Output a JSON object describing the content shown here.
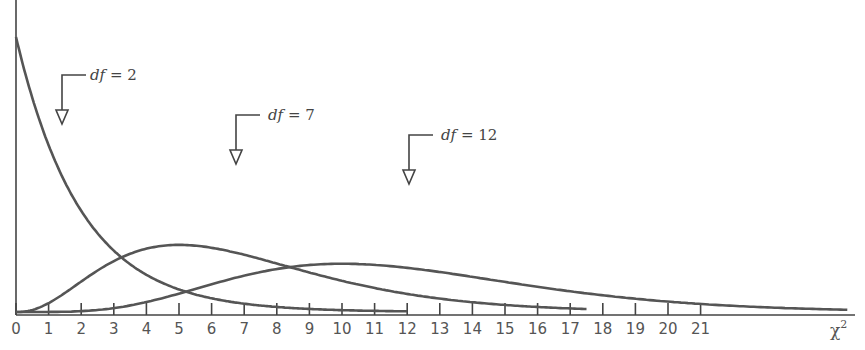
{
  "chart_data": {
    "type": "line",
    "title": "",
    "xlabel": "χ²",
    "ylabel": "",
    "xlim": [
      0,
      25.5
    ],
    "grid": false,
    "legend": "none (inline callout labels with arrows)",
    "x_ticks": [
      0,
      1,
      2,
      3,
      4,
      5,
      6,
      7,
      8,
      9,
      10,
      11,
      12,
      13,
      14,
      15,
      16,
      17,
      18,
      19,
      20,
      21
    ],
    "x_tick_labels": [
      "0",
      "1",
      "2",
      "3",
      "4",
      "5",
      "6",
      "7",
      "8",
      "9",
      "10",
      "11",
      "12",
      "13",
      "14",
      "15",
      "16",
      "17",
      "18",
      "19",
      "20",
      "21"
    ],
    "series": [
      {
        "name": "df = 2",
        "df": 2,
        "x_range": [
          0,
          12
        ],
        "shape": "decreasing exponential from y-axis",
        "peak_x": 0
      },
      {
        "name": "df = 7",
        "df": 7,
        "x_range": [
          0,
          17.5
        ],
        "shape": "right-skewed",
        "peak_x": 5
      },
      {
        "name": "df = 12",
        "df": 12,
        "x_range": [
          0,
          25.5
        ],
        "shape": "right-skewed",
        "peak_x": 10
      }
    ],
    "annotations": [
      {
        "text": "df = 2",
        "arrow_x": 1.4
      },
      {
        "text": "df = 7",
        "arrow_x": 6.7
      },
      {
        "text": "df = 12",
        "arrow_x": 12
      }
    ]
  },
  "labels": {
    "axis_title": "χ",
    "axis_title_sup": "2",
    "df2": {
      "prefix": "df",
      "suffix": " = 2"
    },
    "df7": {
      "prefix": "df",
      "suffix": " = 7"
    },
    "df12": {
      "prefix": "df",
      "suffix": " = 12"
    }
  },
  "style": {
    "line_color": "#555555",
    "axis_color": "#444444"
  }
}
